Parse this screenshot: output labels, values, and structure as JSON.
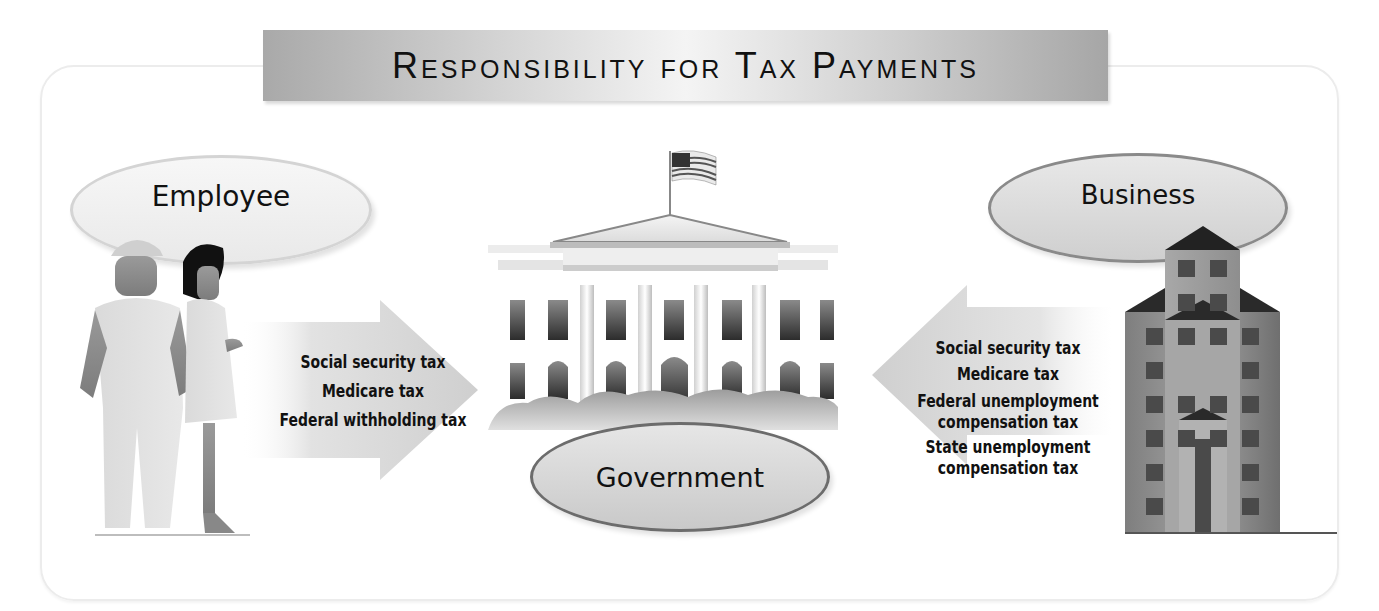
{
  "title": "Responsibility for Tax Payments",
  "entities": {
    "employee": {
      "label": "Employee"
    },
    "government": {
      "label": "Government"
    },
    "business": {
      "label": "Business"
    }
  },
  "flows": {
    "employee_to_government": {
      "direction": "right",
      "taxes": [
        "Social security tax",
        "Medicare tax",
        "Federal withholding tax"
      ]
    },
    "business_to_government": {
      "direction": "left",
      "taxes": [
        "Social security tax",
        "Medicare tax",
        "Federal unemployment compensation tax",
        "State unemployment compensation tax"
      ],
      "display_lines": [
        [
          "Social security tax"
        ],
        [
          "Medicare tax"
        ],
        [
          "Federal unemployment",
          "compensation tax"
        ],
        [
          "State unemployment",
          "compensation tax"
        ]
      ]
    }
  },
  "icons": {
    "employee": "workers-figures-icon",
    "government": "white-house-icon",
    "business": "office-building-icon",
    "flag": "us-flag-icon"
  },
  "colors": {
    "title_bar_edge": "#a9a9a9",
    "title_bar_center": "#f4f4f4",
    "arrow": "#d6d6d6",
    "ellipse_border_light": "#d4d4d4",
    "ellipse_border_dark": "#6c6c6c",
    "building": "#8c8c8c",
    "windows": "#4a4a4a",
    "text": "#111111"
  }
}
